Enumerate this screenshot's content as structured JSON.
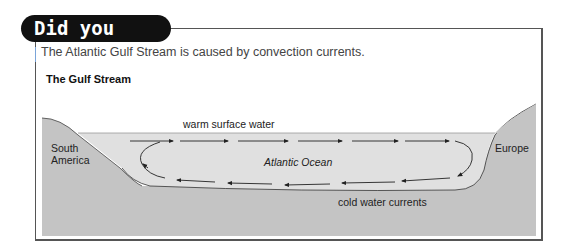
{
  "header": {
    "badge": "Did you know?"
  },
  "intro_text": "The Atlantic Gulf Stream is caused by convection currents.",
  "diagram": {
    "title": "The Gulf Stream",
    "labels": {
      "left_land": [
        "South",
        "America"
      ],
      "right_land": "Europe",
      "ocean": "Atlantic Ocean",
      "top_flow": "warm surface water",
      "bottom_flow": "cold water currents"
    },
    "colors": {
      "land": "#c4c4c4",
      "water": "#e0e0e0",
      "arrow": "#222222"
    }
  }
}
